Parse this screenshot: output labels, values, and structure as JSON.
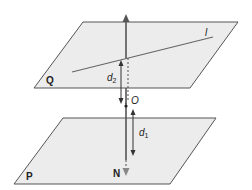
{
  "diagram": {
    "planes": [
      {
        "id": "Q",
        "label": "Q",
        "fill": "#ececec",
        "stroke": "#555555"
      },
      {
        "id": "P",
        "label": "P",
        "fill": "#ececec",
        "stroke": "#555555"
      }
    ],
    "line_label": "l",
    "point_O": "O",
    "normal_label": "N",
    "distance_labels": {
      "d2": {
        "base": "d",
        "sub": "2"
      },
      "d1": {
        "base": "d",
        "sub": "1"
      }
    },
    "colors": {
      "axis": "#555555",
      "arrow": "#333333",
      "normal_tip": "#888888"
    }
  }
}
